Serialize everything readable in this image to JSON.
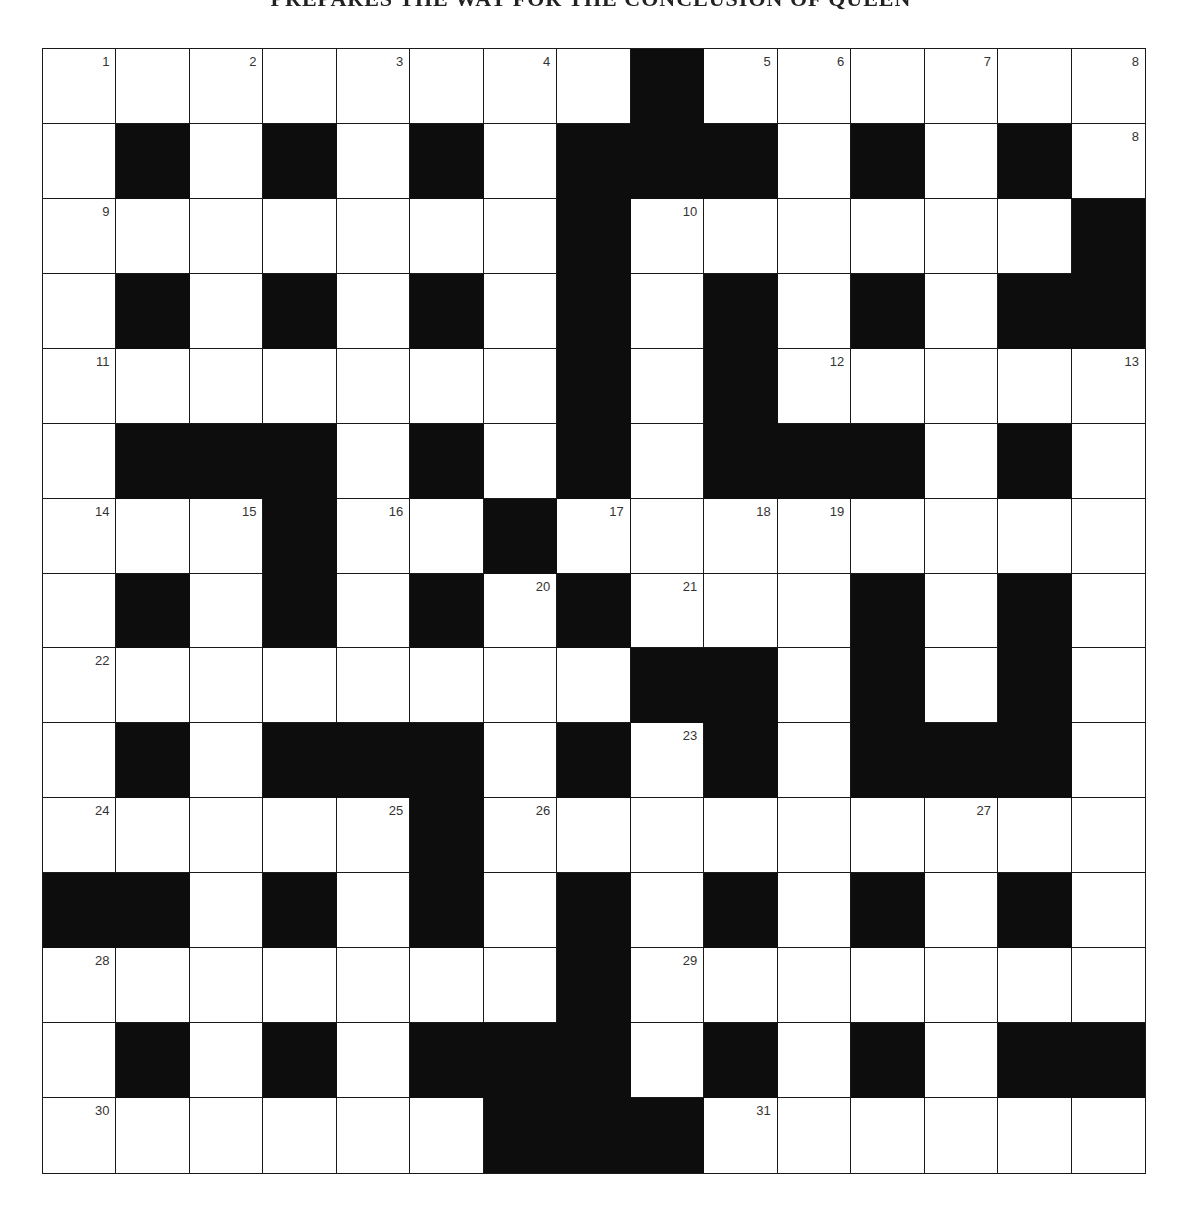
{
  "title": "PREPARES THE WAY FOR THE CONCLUSION OF QUEEN",
  "grid": {
    "rows": 15,
    "cols": 15,
    "colors": {
      "white_cell": "#ffffff",
      "black_cell": "#0d0d0d",
      "border": "#1a1a1a",
      "number": "#333333"
    },
    "layout": [
      "....... #......",
      ".#.#.#.###.#.#.",
      ".......#......#",
      ".#.#.#.#.#.#.##",
      ".......#.#.....",
      ".###.#.#.###.#.",
      "...#..#........",
      ".#.#.#.#...#.#.",
      "........##.#.#.",
      ".#.###.#.#.###.",
      ".....#.........",
      "##.#.#.#.#.#.#.",
      ".......#.......",
      ".#.#.###.#.#.##",
      "......###......"
    ],
    "numbers": [
      {
        "r": 0,
        "c": 0,
        "n": "1"
      },
      {
        "r": 0,
        "c": 2,
        "n": "2"
      },
      {
        "r": 0,
        "c": 4,
        "n": "3"
      },
      {
        "r": 0,
        "c": 6,
        "n": "4"
      },
      {
        "r": 0,
        "c": 9,
        "n": "5"
      },
      {
        "r": 0,
        "c": 10,
        "n": "6"
      },
      {
        "r": 0,
        "c": 12,
        "n": "7"
      },
      {
        "r": 0,
        "c": 14,
        "n": "8"
      },
      {
        "r": 1,
        "c": 14,
        "n": "8"
      },
      {
        "r": 2,
        "c": 0,
        "n": "9"
      },
      {
        "r": 2,
        "c": 8,
        "n": "10"
      },
      {
        "r": 4,
        "c": 0,
        "n": "11"
      },
      {
        "r": 4,
        "c": 10,
        "n": "12"
      },
      {
        "r": 4,
        "c": 14,
        "n": "13"
      },
      {
        "r": 6,
        "c": 0,
        "n": "14"
      },
      {
        "r": 6,
        "c": 2,
        "n": "15"
      },
      {
        "r": 6,
        "c": 4,
        "n": "16"
      },
      {
        "r": 6,
        "c": 7,
        "n": "17"
      },
      {
        "r": 6,
        "c": 9,
        "n": "18"
      },
      {
        "r": 6,
        "c": 10,
        "n": "19"
      },
      {
        "r": 7,
        "c": 6,
        "n": "20"
      },
      {
        "r": 7,
        "c": 8,
        "n": "21"
      },
      {
        "r": 8,
        "c": 0,
        "n": "22"
      },
      {
        "r": 9,
        "c": 8,
        "n": "23"
      },
      {
        "r": 10,
        "c": 0,
        "n": "24"
      },
      {
        "r": 10,
        "c": 4,
        "n": "25"
      },
      {
        "r": 10,
        "c": 6,
        "n": "26"
      },
      {
        "r": 10,
        "c": 12,
        "n": "27"
      },
      {
        "r": 12,
        "c": 0,
        "n": "28"
      },
      {
        "r": 12,
        "c": 8,
        "n": "29"
      },
      {
        "r": 14,
        "c": 0,
        "n": "30"
      },
      {
        "r": 14,
        "c": 9,
        "n": "31"
      }
    ],
    "entries": {}
  }
}
